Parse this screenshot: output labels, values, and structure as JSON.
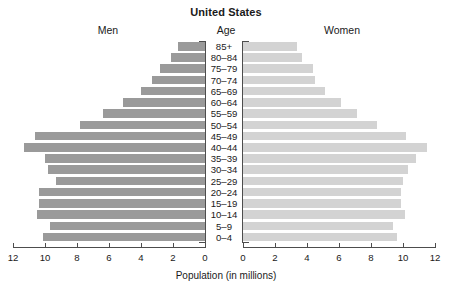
{
  "chart": {
    "title": "United States",
    "men_label": "Men",
    "women_label": "Women",
    "age_axis_label": "Age",
    "x_axis_title": "Population (in millions)"
  },
  "chart_data": {
    "type": "bar",
    "subtype": "population-pyramid",
    "title": "United States",
    "xlabel": "Population (in millions)",
    "ylabel": "Age",
    "grid": false,
    "legend": [
      "Men",
      "Women"
    ],
    "legend_position": "top",
    "xlim_left": [
      12,
      0
    ],
    "xlim_right": [
      0,
      12
    ],
    "x_ticks_left": [
      "12",
      "10",
      "8",
      "6",
      "4",
      "2",
      "0"
    ],
    "x_ticks_right": [
      "0",
      "2",
      "4",
      "6",
      "8",
      "10",
      "12"
    ],
    "categories": [
      "85+",
      "80–84",
      "75–79",
      "70–74",
      "65–69",
      "60–64",
      "55–59",
      "50–54",
      "45–49",
      "40–44",
      "35–39",
      "30–34",
      "25–29",
      "20–24",
      "15–19",
      "10–14",
      "5–9",
      "0–4"
    ],
    "series": [
      {
        "name": "Men",
        "color": "#9a9a9a",
        "side": "left",
        "values": [
          1.7,
          2.1,
          2.8,
          3.3,
          4.0,
          5.1,
          6.4,
          7.8,
          10.6,
          11.3,
          10.0,
          9.8,
          9.3,
          10.4,
          10.4,
          10.5,
          9.7,
          10.1
        ]
      },
      {
        "name": "Women",
        "color": "#d3d3d3",
        "side": "right",
        "values": [
          3.4,
          3.7,
          4.4,
          4.5,
          5.1,
          6.1,
          7.1,
          8.4,
          10.2,
          11.5,
          10.8,
          10.3,
          10.0,
          9.9,
          9.9,
          10.1,
          9.4,
          9.6
        ]
      }
    ]
  }
}
